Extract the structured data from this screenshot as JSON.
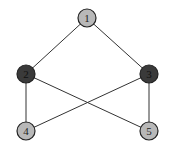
{
  "graph": {
    "nodes": [
      {
        "id": "1",
        "label": "1",
        "x": 87,
        "y": 18,
        "fill": "#b8b8b8",
        "text": "#222222"
      },
      {
        "id": "2",
        "label": "2",
        "x": 26,
        "y": 74,
        "fill": "#3a3a3a",
        "text": "#111111"
      },
      {
        "id": "3",
        "label": "3",
        "x": 149,
        "y": 74,
        "fill": "#3a3a3a",
        "text": "#111111"
      },
      {
        "id": "4",
        "label": "4",
        "x": 26,
        "y": 131,
        "fill": "#b8b8b8",
        "text": "#222222"
      },
      {
        "id": "5",
        "label": "5",
        "x": 149,
        "y": 131,
        "fill": "#b8b8b8",
        "text": "#222222"
      }
    ],
    "edges": [
      {
        "from": "1",
        "to": "2"
      },
      {
        "from": "1",
        "to": "3"
      },
      {
        "from": "2",
        "to": "4"
      },
      {
        "from": "2",
        "to": "5"
      },
      {
        "from": "3",
        "to": "4"
      },
      {
        "from": "3",
        "to": "5"
      }
    ],
    "node_radius": 9,
    "edge_color": "#333333",
    "node_stroke": "#222222"
  }
}
